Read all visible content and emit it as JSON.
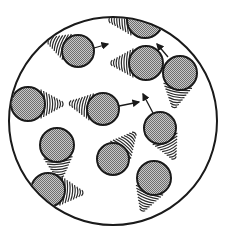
{
  "diagram": {
    "container": {
      "cx": 113,
      "cy": 121,
      "r": 104,
      "stroke": "#1a1a1a"
    },
    "particle_fill": "#9a9a9a",
    "particle_stroke": "#1a1a1a",
    "trail_color": "#2a2a2a",
    "particles": [
      {
        "id": "p1",
        "cx": 145,
        "cy": 20,
        "r": 18,
        "trail_dir": 180,
        "arrow": null
      },
      {
        "id": "p2",
        "cx": 78,
        "cy": 51,
        "r": 16,
        "trail_dir": 200,
        "arrow": {
          "x1": 94,
          "y1": 48,
          "x2": 108,
          "y2": 44
        }
      },
      {
        "id": "p3",
        "cx": 146,
        "cy": 63,
        "r": 17,
        "trail_dir": 180,
        "arrow": null
      },
      {
        "id": "p4",
        "cx": 180,
        "cy": 73,
        "r": 17,
        "trail_dir": 100,
        "arrow": {
          "x1": 168,
          "y1": 57,
          "x2": 157,
          "y2": 44
        }
      },
      {
        "id": "p5",
        "cx": 28,
        "cy": 104,
        "r": 17,
        "trail_dir": 0,
        "arrow": null
      },
      {
        "id": "p6",
        "cx": 103,
        "cy": 109,
        "r": 16,
        "trail_dir": 190,
        "arrow": {
          "x1": 119,
          "y1": 106,
          "x2": 139,
          "y2": 102
        }
      },
      {
        "id": "p7",
        "cx": 160,
        "cy": 128,
        "r": 16,
        "trail_dir": 65,
        "arrow": {
          "x1": 153,
          "y1": 113,
          "x2": 143,
          "y2": 94
        }
      },
      {
        "id": "p8",
        "cx": 57,
        "cy": 145,
        "r": 17,
        "trail_dir": 85,
        "arrow": null
      },
      {
        "id": "p9",
        "cx": 113,
        "cy": 159,
        "r": 16,
        "trail_dir": -50,
        "arrow": null
      },
      {
        "id": "p10",
        "cx": 154,
        "cy": 178,
        "r": 17,
        "trail_dir": 110,
        "arrow": null
      },
      {
        "id": "p11",
        "cx": 48,
        "cy": 190,
        "r": 17,
        "trail_dir": 5,
        "arrow": null
      }
    ]
  }
}
